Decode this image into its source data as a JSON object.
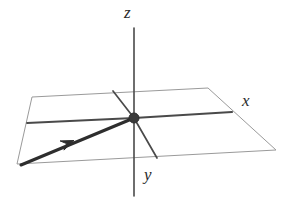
{
  "figure": {
    "kind": "3d-coordinate-axes-diagram",
    "background_color": "#ffffff",
    "width": 296,
    "height": 205
  },
  "labels": {
    "z": "z",
    "x": "x",
    "y": "y"
  },
  "colors": {
    "plane_edge": "#9a9a9a",
    "axis": "#4a4a4a",
    "vector": "#2e2e2e",
    "origin_dot": "#3a3a3a",
    "label_text": "#2b2b2b"
  },
  "chart_data": {
    "type": "scatter",
    "title": "",
    "xlabel": "x",
    "ylabel": "y",
    "zlabel": "z",
    "grid": false,
    "legend": null,
    "projection": "oblique-3d",
    "origin_px": [
      134,
      118
    ],
    "plane_parallelogram_px": [
      [
        32,
        97
      ],
      [
        208,
        88
      ],
      [
        276,
        150
      ],
      [
        17,
        164
      ]
    ],
    "axes": [
      {
        "name": "z-axis",
        "from_px": [
          134,
          196
        ],
        "to_px": [
          134,
          28
        ],
        "arrowhead": false,
        "label": "z",
        "label_px": [
          130,
          12
        ]
      },
      {
        "name": "x-axis",
        "from_px": [
          27,
          123
        ],
        "to_px": [
          232,
          112
        ],
        "arrowhead": false,
        "label": "x",
        "label_px": [
          248,
          100
        ]
      },
      {
        "name": "y-axis",
        "from_px": [
          113,
          91
        ],
        "to_px": [
          157,
          158
        ],
        "arrowhead": false,
        "label": "y",
        "label_px": [
          150,
          174
        ]
      }
    ],
    "vector": {
      "name": "vector-in-xy-plane",
      "tail_px": [
        21,
        165
      ],
      "head_px": [
        134,
        118
      ],
      "arrowhead_px": [
        68,
        143
      ],
      "arrowhead_direction": "toward-origin",
      "label": ""
    },
    "points": [
      {
        "name": "origin",
        "px": [
          134,
          118
        ],
        "marker": "filled-circle",
        "label": ""
      }
    ]
  }
}
